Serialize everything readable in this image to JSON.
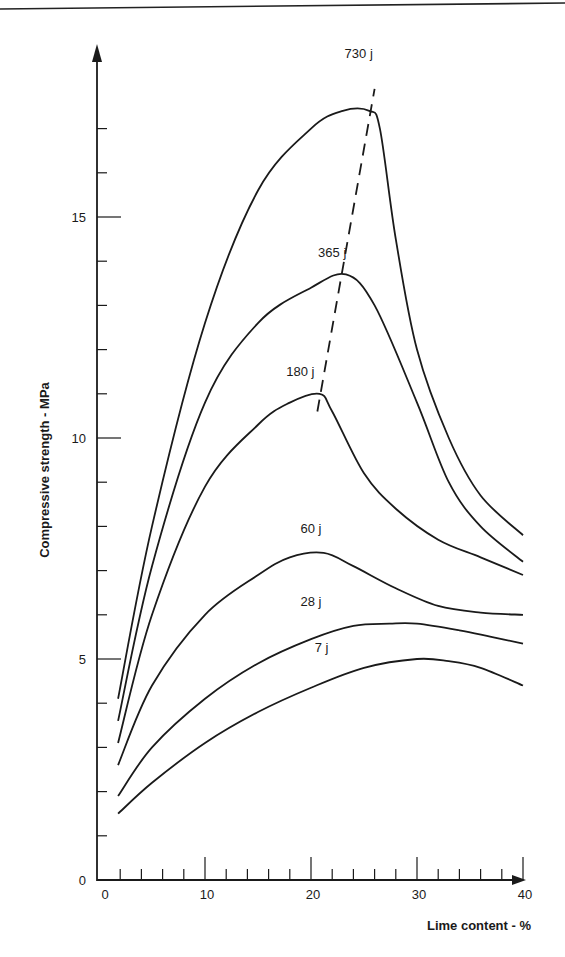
{
  "chart_data": {
    "type": "line",
    "title": "",
    "xlabel": "Lime content - %",
    "ylabel": "Compressive strength - MPa",
    "xlim": [
      0,
      40
    ],
    "ylim": [
      0,
      18
    ],
    "x_ticks": [
      0,
      10,
      20,
      30,
      40
    ],
    "y_ticks": [
      0,
      5,
      10,
      15
    ],
    "grid": false,
    "legend": "inline labels",
    "series": [
      {
        "name": "730 j",
        "label_pos": [
          24.5,
          18.6
        ],
        "points": [
          [
            1.8,
            4.1
          ],
          [
            5,
            8.0
          ],
          [
            10,
            12.6
          ],
          [
            15,
            15.6
          ],
          [
            20,
            17.0
          ],
          [
            23,
            17.4
          ],
          [
            25.5,
            17.4
          ],
          [
            26.5,
            17.0
          ],
          [
            28,
            14.5
          ],
          [
            30,
            12.0
          ],
          [
            33,
            10.0
          ],
          [
            36,
            8.7
          ],
          [
            40,
            7.8
          ]
        ]
      },
      {
        "name": "365 j",
        "label_pos": [
          22,
          14.1
        ],
        "points": [
          [
            1.8,
            3.6
          ],
          [
            5,
            7.1
          ],
          [
            10,
            10.8
          ],
          [
            15,
            12.6
          ],
          [
            20,
            13.4
          ],
          [
            23.3,
            13.7
          ],
          [
            26,
            13.0
          ],
          [
            30,
            10.8
          ],
          [
            33,
            9.0
          ],
          [
            36,
            8.0
          ],
          [
            40,
            7.2
          ]
        ]
      },
      {
        "name": "180 j",
        "label_pos": [
          19,
          11.4
        ],
        "points": [
          [
            1.8,
            3.1
          ],
          [
            5,
            6.0
          ],
          [
            10,
            8.9
          ],
          [
            15,
            10.3
          ],
          [
            18,
            10.8
          ],
          [
            20.8,
            11.0
          ],
          [
            22,
            10.6
          ],
          [
            25,
            9.2
          ],
          [
            28,
            8.4
          ],
          [
            32,
            7.7
          ],
          [
            36,
            7.3
          ],
          [
            40,
            6.9
          ]
        ]
      },
      {
        "name": "60 j",
        "label_pos": [
          20,
          7.85
        ],
        "points": [
          [
            1.8,
            2.6
          ],
          [
            5,
            4.4
          ],
          [
            10,
            6.0
          ],
          [
            15,
            6.9
          ],
          [
            18,
            7.3
          ],
          [
            21.2,
            7.4
          ],
          [
            24,
            7.1
          ],
          [
            28,
            6.6
          ],
          [
            32,
            6.2
          ],
          [
            36,
            6.05
          ],
          [
            40,
            6.0
          ]
        ]
      },
      {
        "name": "28 j",
        "label_pos": [
          20,
          6.2
        ],
        "points": [
          [
            1.8,
            1.9
          ],
          [
            5,
            3.0
          ],
          [
            10,
            4.1
          ],
          [
            15,
            4.9
          ],
          [
            20,
            5.45
          ],
          [
            24,
            5.75
          ],
          [
            27.4,
            5.8
          ],
          [
            30,
            5.8
          ],
          [
            34,
            5.65
          ],
          [
            37,
            5.5
          ],
          [
            40,
            5.35
          ]
        ]
      },
      {
        "name": "7 j",
        "label_pos": [
          21,
          5.15
        ],
        "points": [
          [
            1.8,
            1.5
          ],
          [
            5,
            2.2
          ],
          [
            10,
            3.1
          ],
          [
            15,
            3.8
          ],
          [
            20,
            4.35
          ],
          [
            25,
            4.8
          ],
          [
            30,
            5.0
          ],
          [
            33,
            4.95
          ],
          [
            36,
            4.8
          ],
          [
            40,
            4.4
          ]
        ]
      }
    ],
    "annotations": [
      {
        "type": "dashed-line",
        "description": "locus of maxima",
        "from": [
          20.6,
          10.6
        ],
        "to": [
          26,
          17.9
        ]
      }
    ]
  },
  "labels": {
    "xlabel": "Lime content - %",
    "ylabel": "Compressive strength - MPa",
    "x_ticks": [
      "0",
      "10",
      "20",
      "30",
      "40"
    ],
    "y_ticks": [
      "0",
      "5",
      "10",
      "15"
    ]
  }
}
